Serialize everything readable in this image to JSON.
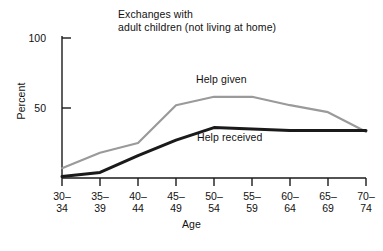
{
  "chart_data": {
    "type": "line",
    "title": "Exchanges with adult children (not living at home)",
    "title_line1": "Exchanges with",
    "title_line2": "adult children (not living at home)",
    "xlabel": "Age",
    "ylabel": "Percent",
    "categories": [
      "30–34",
      "35–39",
      "40–44",
      "45–49",
      "50–54",
      "55–59",
      "60–64",
      "65–69",
      "70–74"
    ],
    "category_lines": [
      {
        "top": "30–",
        "bottom": "34"
      },
      {
        "top": "35–",
        "bottom": "39"
      },
      {
        "top": "40–",
        "bottom": "44"
      },
      {
        "top": "45–",
        "bottom": "49"
      },
      {
        "top": "50–",
        "bottom": "54"
      },
      {
        "top": "55–",
        "bottom": "59"
      },
      {
        "top": "60–",
        "bottom": "64"
      },
      {
        "top": "65–",
        "bottom": "69"
      },
      {
        "top": "70–",
        "bottom": "74"
      }
    ],
    "ylim": [
      0,
      100
    ],
    "yticks": [
      50,
      100
    ],
    "ytick_labels": [
      "50",
      "100"
    ],
    "grid": false,
    "legend_position": "inline-annotation",
    "series": [
      {
        "name": "Help given",
        "color": "#9a9a9a",
        "line_width": 2.2,
        "values": [
          7,
          18,
          25,
          52,
          58,
          58,
          52,
          47,
          33
        ]
      },
      {
        "name": "Help received",
        "color": "#1a1a1a",
        "line_width": 3.0,
        "values": [
          1,
          4,
          16,
          27,
          36,
          35,
          34,
          34,
          34
        ]
      }
    ]
  },
  "axes": {
    "y_tick_top_label": "100",
    "y_tick_mid_label": "50"
  }
}
